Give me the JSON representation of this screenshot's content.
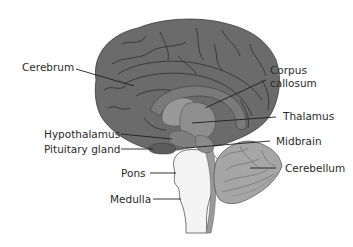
{
  "diagram": {
    "type": "labeled-anatomy-diagram",
    "colors": {
      "cerebrum": "#6b6b6b",
      "sulci": "#2e2e2e",
      "corpus_callosum": "#7a7a7a",
      "thalamus": "#8e8e8e",
      "hypothalamus": "#7f7f7f",
      "pituitary": "#5c5c5c",
      "midbrain": "#8a8a8a",
      "brainstem_stripe": "#9a9a9a",
      "pons_medulla": "#f4f4f4",
      "cerebellum": "#a6a6a6",
      "leader_line": "#1e1e1e",
      "label_text": "#2a2a2a",
      "background": "#ffffff"
    },
    "labels": {
      "cerebrum": "Cerebrum",
      "corpus_callosum_line1": "Corpus",
      "corpus_callosum_line2": "callosum",
      "thalamus": "Thalamus",
      "hypothalamus": "Hypothalamus",
      "pituitary_gland": "Pituitary gland",
      "midbrain": "Midbrain",
      "cerebellum": "Cerebellum",
      "pons": "Pons",
      "medulla": "Medulla"
    }
  }
}
